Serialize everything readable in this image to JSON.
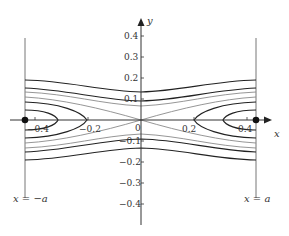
{
  "diagram": {
    "type": "phase-portrait",
    "axes": {
      "x_label": "x",
      "y_label": "y",
      "x_ticks": [
        "−0.4",
        "−0.2",
        "0",
        "0.2",
        "0.4"
      ],
      "y_ticks": [
        "0.4",
        "0.3",
        "0.2",
        "0.1",
        "−0.1",
        "−0.2",
        "−0.3",
        "−0.4"
      ]
    },
    "boundaries": {
      "left_label": "x = −a",
      "right_label": "x = a"
    },
    "colors": {
      "curve": "#222222",
      "separatrix": "#888888",
      "axis": "#333333",
      "boundary": "#777777"
    }
  }
}
